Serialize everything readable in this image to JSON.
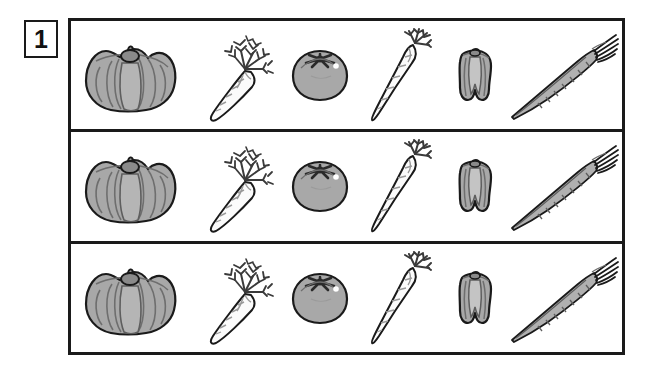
{
  "worksheet": {
    "exercise_number": "1",
    "panel_label": "vegetable-row-panel",
    "row_count": 3,
    "items_per_row": 6
  },
  "colors": {
    "outline": "#1a1a1a",
    "page_background": "#ffffff",
    "vegetable_gray": "#a8a8a8",
    "vegetable_gray_light": "#c4c4c4",
    "vegetable_gray_dark": "#8a8a8a",
    "leaf_dark": "#3a3a3a",
    "white_fill": "#fbfbfb",
    "highlight": "#ffffff"
  },
  "rows": [
    {
      "label": "Row 1",
      "items": [
        {
          "name": "bell-pepper-top",
          "label": "Bell pepper"
        },
        {
          "name": "carrot-with-greens",
          "label": "Carrot with greens"
        },
        {
          "name": "tomato",
          "label": "Tomato"
        },
        {
          "name": "parsnip",
          "label": "Parsnip"
        },
        {
          "name": "bell-pepper-side",
          "label": "Small bell pepper"
        },
        {
          "name": "leek",
          "label": "Leek"
        }
      ]
    },
    {
      "label": "Row 2",
      "items": [
        {
          "name": "bell-pepper-top",
          "label": "Bell pepper"
        },
        {
          "name": "carrot-with-greens",
          "label": "Carrot with greens"
        },
        {
          "name": "tomato",
          "label": "Tomato"
        },
        {
          "name": "parsnip",
          "label": "Parsnip"
        },
        {
          "name": "bell-pepper-side",
          "label": "Small bell pepper"
        },
        {
          "name": "leek",
          "label": "Leek"
        }
      ]
    },
    {
      "label": "Row 3",
      "items": [
        {
          "name": "bell-pepper-top",
          "label": "Bell pepper"
        },
        {
          "name": "carrot-with-greens",
          "label": "Carrot with greens"
        },
        {
          "name": "tomato",
          "label": "Tomato"
        },
        {
          "name": "parsnip",
          "label": "Parsnip"
        },
        {
          "name": "bell-pepper-side",
          "label": "Small bell pepper"
        },
        {
          "name": "leek",
          "label": "Leek"
        }
      ]
    }
  ]
}
